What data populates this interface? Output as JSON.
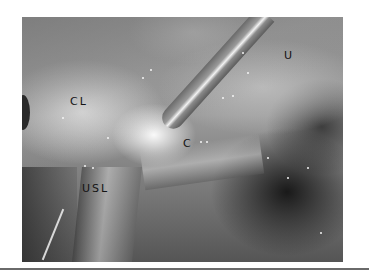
{
  "figure": {
    "labels": [
      {
        "text": "CL",
        "x": 48,
        "y": 78
      },
      {
        "text": "U",
        "x": 262,
        "y": 32
      },
      {
        "text": "C",
        "x": 161,
        "y": 120
      },
      {
        "text": "USL",
        "x": 60,
        "y": 165
      }
    ]
  }
}
